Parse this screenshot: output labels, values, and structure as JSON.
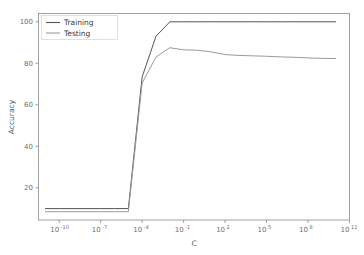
{
  "chart_data": {
    "type": "line",
    "title": "",
    "xlabel": "C",
    "ylabel": "Accuracy",
    "xscale": "log",
    "yscale": "linear",
    "grid": false,
    "legend_position": "upper left",
    "xlim": [
      3.16e-12,
      100000000000.0
    ],
    "ylim": [
      4.5,
      104
    ],
    "ytick_labels": [
      "20",
      "40",
      "60",
      "80",
      "100"
    ],
    "ytick_values": [
      20,
      40,
      60,
      80,
      100
    ],
    "xtick_labels": [
      "10⁻¹⁰",
      "10⁻⁷",
      "10⁻⁴",
      "10⁻¹",
      "10²",
      "10⁵",
      "10⁸",
      "10¹¹"
    ],
    "xtick_bases": [
      "10",
      "10",
      "10",
      "10",
      "10",
      "10",
      "10",
      "10"
    ],
    "xtick_exponents": [
      "-10",
      "-7",
      "-4",
      "-1",
      "2",
      "5",
      "8",
      "11"
    ],
    "xtick_values": [
      1e-10,
      1e-07,
      0.0001,
      0.1,
      100.0,
      100000.0,
      100000000.0,
      100000000000.0
    ],
    "x": [
      1e-11,
      1e-10,
      1e-09,
      1e-08,
      1e-07,
      1e-06,
      1e-05,
      0.0001,
      0.001,
      0.01,
      0.1,
      1,
      10,
      100,
      1000,
      10000.0,
      100000.0,
      1000000.0,
      10000000.0,
      100000000.0,
      1000000000.0,
      10000000000.0
    ],
    "series": [
      {
        "name": "Training",
        "color": "#555555",
        "values": [
          10.0,
          10.0,
          10.0,
          10.0,
          10.0,
          10.0,
          10.0,
          73.5,
          93.0,
          100.0,
          100.0,
          100.0,
          100.0,
          100.0,
          100.0,
          100.0,
          100.0,
          100.0,
          100.0,
          100.0,
          100.0,
          100.0
        ]
      },
      {
        "name": "Testing",
        "color": "#9a9a9a",
        "values": [
          8.5,
          8.5,
          8.5,
          8.5,
          8.5,
          8.5,
          8.5,
          70.5,
          83.0,
          87.5,
          86.5,
          86.3,
          85.5,
          84.2,
          83.8,
          83.6,
          83.4,
          83.1,
          82.9,
          82.6,
          82.4,
          82.3
        ]
      }
    ]
  },
  "legend": {
    "entries": [
      {
        "label": "Training",
        "color": "#555555"
      },
      {
        "label": "Testing",
        "color": "#9a9a9a"
      }
    ]
  },
  "axes": {
    "x_title": "C",
    "y_title": "Accuracy"
  }
}
